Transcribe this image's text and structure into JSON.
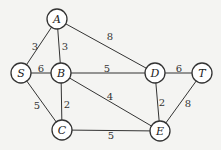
{
  "graph": {
    "colors": {
      "background": "#f4f4f2",
      "stroke": "#333333",
      "node_fill": "#ffffff"
    },
    "nodes": [
      {
        "id": "A",
        "label": "A",
        "x": 57,
        "y": 19
      },
      {
        "id": "S",
        "label": "S",
        "x": 21,
        "y": 73
      },
      {
        "id": "B",
        "label": "B",
        "x": 61,
        "y": 73
      },
      {
        "id": "D",
        "label": "D",
        "x": 155,
        "y": 73
      },
      {
        "id": "T",
        "label": "T",
        "x": 202,
        "y": 73
      },
      {
        "id": "C",
        "label": "C",
        "x": 62,
        "y": 130
      },
      {
        "id": "E",
        "label": "E",
        "x": 160,
        "y": 131
      }
    ],
    "edges": [
      {
        "from": "S",
        "to": "A",
        "weight": "3",
        "lx": 35,
        "ly": 47
      },
      {
        "from": "A",
        "to": "B",
        "weight": "3",
        "lx": 65,
        "ly": 47
      },
      {
        "from": "A",
        "to": "D",
        "weight": "8",
        "lx": 110,
        "ly": 37
      },
      {
        "from": "S",
        "to": "B",
        "weight": "6",
        "lx": 41,
        "ly": 69
      },
      {
        "from": "B",
        "to": "D",
        "weight": "5",
        "lx": 107,
        "ly": 69
      },
      {
        "from": "D",
        "to": "T",
        "weight": "6",
        "lx": 179,
        "ly": 69
      },
      {
        "from": "S",
        "to": "C",
        "weight": "5",
        "lx": 37,
        "ly": 106
      },
      {
        "from": "B",
        "to": "C",
        "weight": "2",
        "lx": 67,
        "ly": 105
      },
      {
        "from": "B",
        "to": "E",
        "weight": "4",
        "lx": 110,
        "ly": 97
      },
      {
        "from": "C",
        "to": "E",
        "weight": "5",
        "lx": 111,
        "ly": 136
      },
      {
        "from": "D",
        "to": "E",
        "weight": "2",
        "lx": 162,
        "ly": 103
      },
      {
        "from": "T",
        "to": "E",
        "weight": "8",
        "lx": 188,
        "ly": 104
      }
    ]
  }
}
